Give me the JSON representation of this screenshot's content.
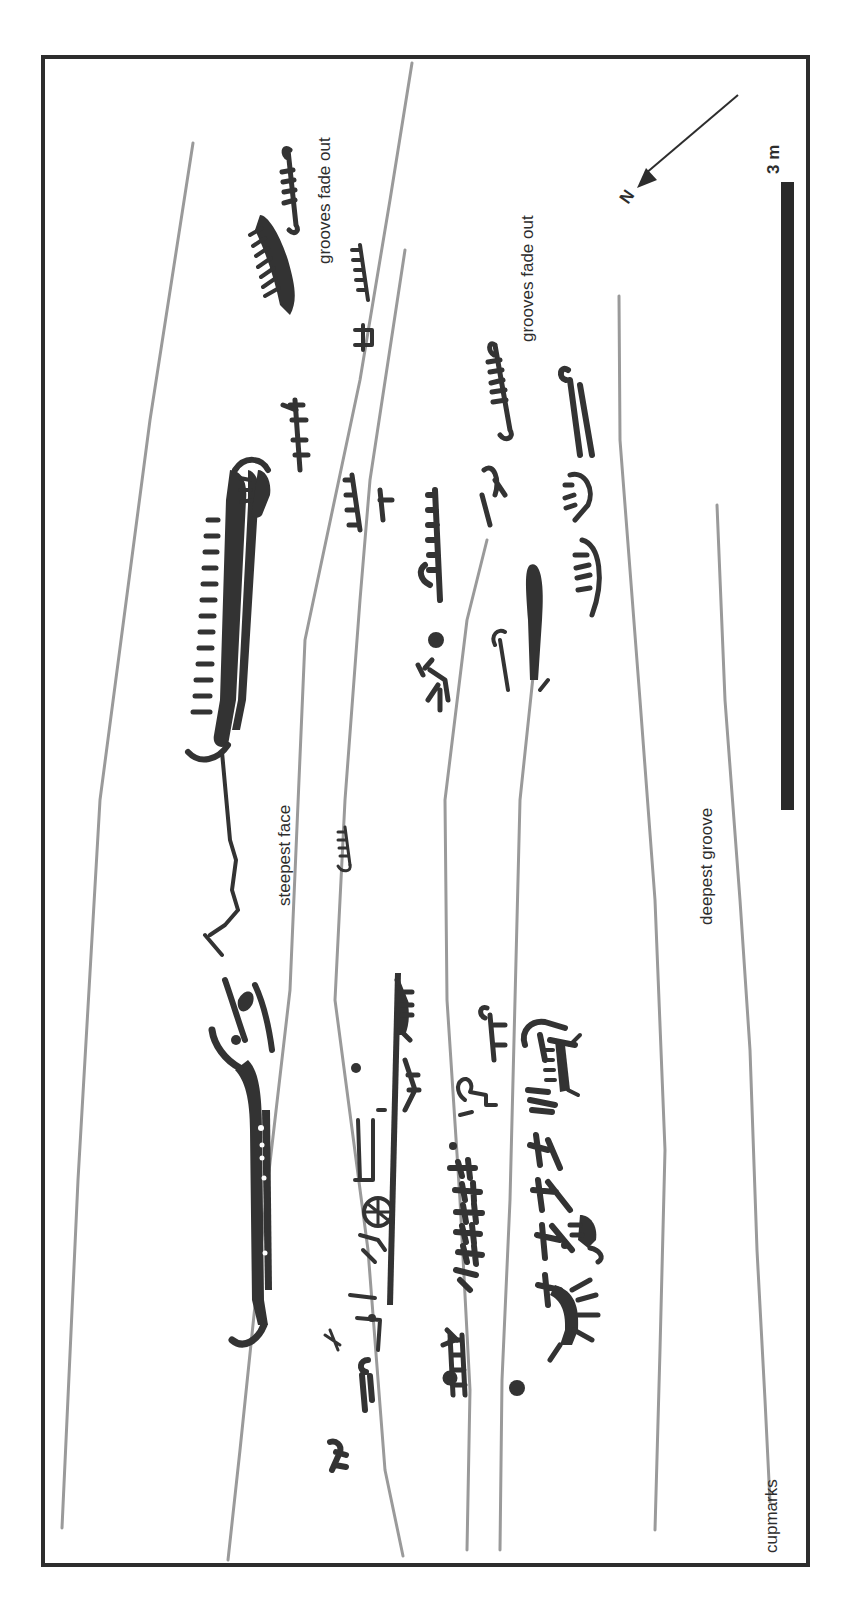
{
  "figure": {
    "kind": "rock-art panel tracing (rotated 90°)",
    "colors": {
      "background": "#ffffff",
      "frame": "#2d2d2d",
      "fissure": "#9a9a9a",
      "carving": "#333333",
      "scale_bar": "#2a2a2a",
      "text": "#2d2d2d"
    },
    "labels": {
      "grooves_fade_out_top": "grooves fade out",
      "grooves_fade_out_mid": "grooves fade out",
      "steepest_face": "steepest face",
      "deepest_groove": "deepest groove",
      "cupmarks": "cupmarks"
    },
    "north_arrow": {
      "label": "N",
      "icon": "north-arrow-icon"
    },
    "scale_bar": {
      "label": "3 m",
      "length_m": 3
    }
  }
}
